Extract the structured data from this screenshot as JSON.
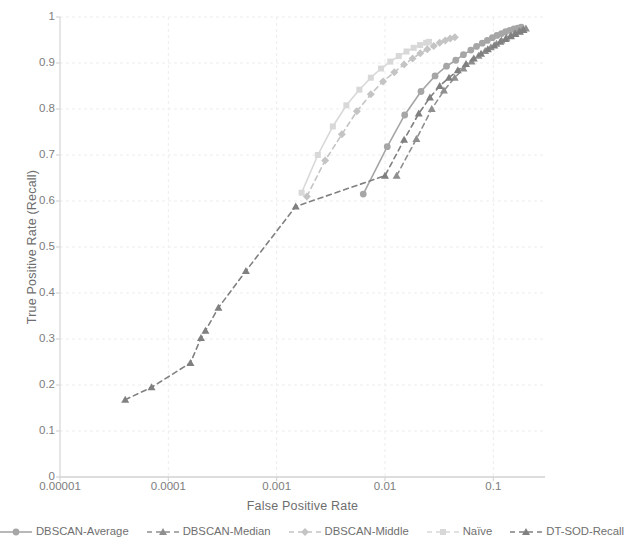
{
  "chart_data": {
    "type": "line",
    "title": "",
    "xlabel": "False Positive Rate",
    "ylabel": "True Positive Rate (Recall)",
    "xscale": "log",
    "yscale": "linear",
    "xlim": [
      1e-05,
      0.3
    ],
    "ylim": [
      0,
      1
    ],
    "grid": true,
    "legend_position": "bottom",
    "x_tick_labels": [
      "0.00001",
      "0.0001",
      "0.001",
      "0.01",
      "0.1"
    ],
    "x_tick_values": [
      1e-05,
      0.0001,
      0.001,
      0.01,
      0.1
    ],
    "y_tick_labels": [
      "0",
      "0.1",
      "0.2",
      "0.3",
      "0.4",
      "0.5",
      "0.6",
      "0.7",
      "0.8",
      "0.9",
      "1"
    ],
    "y_tick_values": [
      0,
      0.1,
      0.2,
      0.3,
      0.4,
      0.5,
      0.6,
      0.7,
      0.8,
      0.9,
      1
    ],
    "series": [
      {
        "name": "DBSCAN-Average",
        "color": "#a6a6a6",
        "marker": "circle",
        "dash": "solid",
        "points": [
          [
            0.0063,
            0.615
          ],
          [
            0.0105,
            0.718
          ],
          [
            0.0152,
            0.787
          ],
          [
            0.0215,
            0.838
          ],
          [
            0.029,
            0.872
          ],
          [
            0.037,
            0.893
          ],
          [
            0.045,
            0.906
          ],
          [
            0.053,
            0.918
          ],
          [
            0.062,
            0.928
          ],
          [
            0.07,
            0.936
          ],
          [
            0.079,
            0.943
          ],
          [
            0.088,
            0.949
          ],
          [
            0.098,
            0.955
          ],
          [
            0.108,
            0.96
          ],
          [
            0.119,
            0.964
          ],
          [
            0.13,
            0.968
          ],
          [
            0.142,
            0.971
          ],
          [
            0.155,
            0.974
          ],
          [
            0.168,
            0.976
          ],
          [
            0.181,
            0.978
          ]
        ]
      },
      {
        "name": "DBSCAN-Median",
        "color": "#8f8f8f",
        "marker": "triangle",
        "dash": "dashed",
        "points": [
          [
            0.0128,
            0.655
          ],
          [
            0.0195,
            0.735
          ],
          [
            0.027,
            0.8
          ],
          [
            0.035,
            0.84
          ],
          [
            0.044,
            0.868
          ],
          [
            0.053,
            0.888
          ],
          [
            0.063,
            0.903
          ],
          [
            0.073,
            0.916
          ],
          [
            0.084,
            0.926
          ],
          [
            0.095,
            0.934
          ],
          [
            0.107,
            0.942
          ],
          [
            0.119,
            0.949
          ],
          [
            0.132,
            0.955
          ],
          [
            0.145,
            0.96
          ],
          [
            0.158,
            0.965
          ],
          [
            0.172,
            0.969
          ],
          [
            0.186,
            0.972
          ],
          [
            0.2,
            0.975
          ]
        ]
      },
      {
        "name": "DBSCAN-Middle",
        "color": "#c4c4c4",
        "marker": "diamond",
        "dash": "dashed",
        "points": [
          [
            0.0019,
            0.61
          ],
          [
            0.0028,
            0.688
          ],
          [
            0.004,
            0.745
          ],
          [
            0.0055,
            0.795
          ],
          [
            0.0074,
            0.832
          ],
          [
            0.0096,
            0.86
          ],
          [
            0.0122,
            0.88
          ],
          [
            0.015,
            0.897
          ],
          [
            0.018,
            0.91
          ],
          [
            0.0212,
            0.921
          ],
          [
            0.0246,
            0.93
          ],
          [
            0.0282,
            0.937
          ],
          [
            0.032,
            0.944
          ],
          [
            0.036,
            0.949
          ],
          [
            0.04,
            0.953
          ],
          [
            0.0442,
            0.956
          ]
        ]
      },
      {
        "name": "Naïve",
        "color": "#d8d8d8",
        "marker": "square",
        "dash": "solid",
        "points": [
          [
            0.0017,
            0.618
          ],
          [
            0.0024,
            0.7
          ],
          [
            0.0033,
            0.762
          ],
          [
            0.0044,
            0.808
          ],
          [
            0.0058,
            0.842
          ],
          [
            0.0074,
            0.868
          ],
          [
            0.0092,
            0.888
          ],
          [
            0.0112,
            0.903
          ],
          [
            0.0134,
            0.915
          ],
          [
            0.0158,
            0.925
          ],
          [
            0.0184,
            0.933
          ],
          [
            0.0211,
            0.939
          ],
          [
            0.024,
            0.944
          ],
          [
            0.0255,
            0.946
          ]
        ]
      },
      {
        "name": "DT-SOD-Recall",
        "color": "#808080",
        "marker": "triangle",
        "dash": "dashed",
        "points": [
          [
            4e-05,
            0.168
          ],
          [
            7e-05,
            0.195
          ],
          [
            0.00016,
            0.248
          ],
          [
            0.0002,
            0.302
          ],
          [
            0.00022,
            0.318
          ],
          [
            0.00029,
            0.368
          ],
          [
            0.00052,
            0.448
          ],
          [
            0.0015,
            0.588
          ],
          [
            0.01,
            0.655
          ],
          [
            0.015,
            0.733
          ],
          [
            0.0205,
            0.79
          ],
          [
            0.026,
            0.825
          ],
          [
            0.032,
            0.85
          ],
          [
            0.039,
            0.868
          ],
          [
            0.047,
            0.884
          ],
          [
            0.056,
            0.898
          ],
          [
            0.066,
            0.91
          ],
          [
            0.077,
            0.92
          ],
          [
            0.089,
            0.93
          ],
          [
            0.102,
            0.938
          ],
          [
            0.116,
            0.946
          ],
          [
            0.13,
            0.952
          ],
          [
            0.145,
            0.958
          ],
          [
            0.16,
            0.963
          ],
          [
            0.176,
            0.968
          ],
          [
            0.19,
            0.972
          ]
        ]
      }
    ]
  },
  "axes": {
    "x_title": "False Positive Rate",
    "y_title": "True Positive Rate (Recall)"
  },
  "legend": {
    "items": [
      {
        "label": "DBSCAN-Average",
        "marker": "circle-marker",
        "color": "#a6a6a6",
        "dash": "solid"
      },
      {
        "label": "DBSCAN-Median",
        "marker": "triangle-marker",
        "color": "#8f8f8f",
        "dash": "dashed"
      },
      {
        "label": "DBSCAN-Middle",
        "marker": "diamond-marker",
        "color": "#c4c4c4",
        "dash": "dashed"
      },
      {
        "label": "Naïve",
        "marker": "square-marker",
        "color": "#d8d8d8",
        "dash": "dashed"
      },
      {
        "label": "DT-SOD-Recall",
        "marker": "triangle-marker",
        "color": "#808080",
        "dash": "dashed"
      }
    ]
  },
  "style": {
    "grid_color": "#ededed",
    "axis_color": "#d2d2d2",
    "text_color": "#7a7a7a",
    "background": "#ffffff"
  }
}
